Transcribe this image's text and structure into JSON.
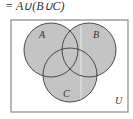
{
  "formula": "= A∪(B∪C)",
  "universe_label": "U",
  "sets": [
    {
      "label": "A",
      "cx": 51,
      "cy": 50,
      "r": 27
    },
    {
      "label": "B",
      "cx": 89,
      "cy": 50,
      "r": 27
    },
    {
      "label": "C",
      "cx": 70,
      "cy": 75,
      "r": 27
    }
  ],
  "colors": {
    "fill": "#c8c8c8",
    "stroke": "#3a3a3a",
    "frame": "#777777"
  }
}
